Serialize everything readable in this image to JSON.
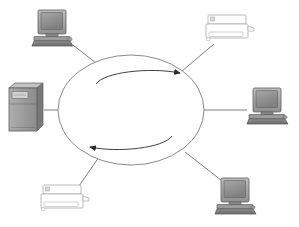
{
  "diagram": {
    "background_color": "#ffffff",
    "width": 299,
    "height": 227,
    "caption": ""
  },
  "colors": {
    "line": "#6b6b6b",
    "ellipse_stroke": "#7d7d7d",
    "arrow": "#2b2b2b",
    "device_dark": "#5a5a5a",
    "device_mid": "#8c8c8c",
    "device_light": "#b8b8b8",
    "device_screen": "#9a9a9a",
    "device_screen_dark": "#6e6e6e",
    "outline_device_stroke": "#a9a9a9",
    "outline_device_fill": "#ffffff",
    "shadow": "#cfcfcf"
  },
  "hub": {
    "label": "network-ring",
    "center_x": 131,
    "center_y": 110,
    "radius_x": 73,
    "radius_y": 55,
    "flow_arrows": [
      {
        "name": "clockwise-top-arrow",
        "direction": "right",
        "label": ""
      },
      {
        "name": "counterclockwise-bottom-arrow",
        "direction": "left",
        "label": ""
      }
    ]
  },
  "nodes": [
    {
      "id": "node-top-left",
      "type": "desktop-computer",
      "label": "",
      "x": 52,
      "y": 29,
      "link_from_x": 73,
      "link_from_y": 45,
      "link_to_x": 100,
      "link_to_y": 66
    },
    {
      "id": "node-top-right",
      "type": "printer",
      "label": "",
      "x": 228,
      "y": 29,
      "link_from_x": 213,
      "link_from_y": 44,
      "link_to_x": 183,
      "link_to_y": 70
    },
    {
      "id": "node-left",
      "type": "server-tower",
      "label": "",
      "x": 27,
      "y": 108,
      "link_from_x": 44,
      "link_from_y": 110,
      "link_to_x": 58,
      "link_to_y": 110
    },
    {
      "id": "node-right",
      "type": "desktop-computer",
      "label": "",
      "x": 269,
      "y": 110,
      "link_from_x": 247,
      "link_from_y": 110,
      "link_to_x": 204,
      "link_to_y": 110
    },
    {
      "id": "node-bottom-left",
      "type": "printer",
      "label": "",
      "x": 63,
      "y": 198,
      "link_from_x": 78,
      "link_from_y": 186,
      "link_to_x": 101,
      "link_to_y": 155
    },
    {
      "id": "node-bottom-right",
      "type": "desktop-computer",
      "label": "",
      "x": 235,
      "y": 196,
      "link_from_x": 221,
      "link_from_y": 180,
      "link_to_x": 186,
      "link_to_y": 152
    }
  ]
}
